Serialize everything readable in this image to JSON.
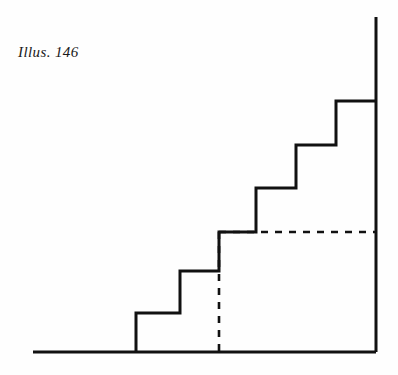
{
  "figure": {
    "caption": "Illus. 146",
    "ink_color": "#111111",
    "paper_color": "#fefefe"
  },
  "chart_data": {
    "type": "line",
    "title": "Illus. 146",
    "subtitle": "",
    "xlabel": "",
    "ylabel": "",
    "grid": false,
    "legend_position": "none",
    "xlim": [
      33,
      377
    ],
    "ylim": [
      17,
      352
    ],
    "series": [
      {
        "name": "baseline",
        "style": "solid",
        "x": [
          33,
          376
        ],
        "y": [
          352,
          352
        ]
      },
      {
        "name": "step-profile",
        "style": "solid",
        "x": [
          136,
          136,
          180,
          180,
          219,
          219,
          256,
          256,
          296,
          296,
          336,
          336,
          376
        ],
        "y": [
          352,
          313,
          313,
          271,
          271,
          232,
          232,
          188,
          188,
          145,
          145,
          101,
          101
        ]
      },
      {
        "name": "right-vertical",
        "style": "solid",
        "x": [
          376,
          376
        ],
        "y": [
          17,
          352
        ]
      },
      {
        "name": "dashed-vertical",
        "style": "dashed",
        "x": [
          219,
          219
        ],
        "y": [
          232,
          352
        ]
      },
      {
        "name": "dashed-horizontal",
        "style": "dashed",
        "x": [
          219,
          376
        ],
        "y": [
          232,
          232
        ]
      }
    ],
    "steps": [
      {
        "index": 1,
        "riser_x": 136,
        "tread_y": 313,
        "tread_from_x": 136,
        "tread_to_x": 180
      },
      {
        "index": 2,
        "riser_x": 180,
        "tread_y": 271,
        "tread_from_x": 180,
        "tread_to_x": 219
      },
      {
        "index": 3,
        "riser_x": 219,
        "tread_y": 232,
        "tread_from_x": 219,
        "tread_to_x": 256
      },
      {
        "index": 4,
        "riser_x": 256,
        "tread_y": 188,
        "tread_from_x": 256,
        "tread_to_x": 296
      },
      {
        "index": 5,
        "riser_x": 296,
        "tread_y": 145,
        "tread_from_x": 296,
        "tread_to_x": 336
      },
      {
        "index": 6,
        "riser_x": 336,
        "tread_y": 101,
        "tread_from_x": 336,
        "tread_to_x": 376
      }
    ]
  }
}
